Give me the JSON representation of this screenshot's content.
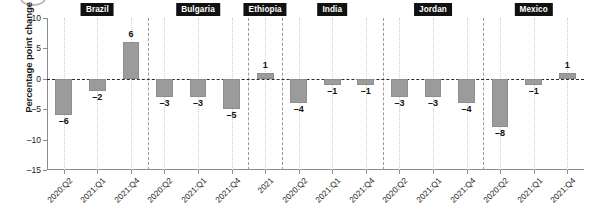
{
  "chart_data": {
    "type": "bar",
    "title": "",
    "subtitle": "",
    "xlabel": "",
    "ylabel": "Percentage point change",
    "ylim": [
      -15,
      10
    ],
    "yticks": [
      10,
      5,
      0,
      -5,
      -10,
      -15
    ],
    "ytick_labels": [
      "10",
      "5",
      "0",
      "-5",
      "-10",
      "-15"
    ],
    "grid": true,
    "grid_orientation": "vertical",
    "legend": null,
    "zero_line": true,
    "panel_layout": "faceted-by-country",
    "bar_color": "#9b9b9b",
    "panels": [
      {
        "label": "Brazil",
        "categories": [
          "2020:Q2",
          "2021:Q1",
          "2021:Q4"
        ],
        "values": [
          -6,
          -2,
          6
        ],
        "value_labels": [
          "–6",
          "–2",
          "6"
        ]
      },
      {
        "label": "Bulgaria",
        "categories": [
          "2020:Q2",
          "2021:Q1",
          "2021:Q4"
        ],
        "values": [
          -3,
          -3,
          -5
        ],
        "value_labels": [
          "–3",
          "–3",
          "–5"
        ]
      },
      {
        "label": "Ethiopia",
        "categories": [
          "2021"
        ],
        "values": [
          1
        ],
        "value_labels": [
          "1"
        ]
      },
      {
        "label": "India",
        "categories": [
          "2020:Q2",
          "2021:Q1",
          "2021:Q4"
        ],
        "values": [
          -4,
          -1,
          -1
        ],
        "value_labels": [
          "–4",
          "–1",
          "–1"
        ]
      },
      {
        "label": "Jordan",
        "categories": [
          "2020:Q2",
          "2021:Q1",
          "2021:Q4"
        ],
        "values": [
          -3,
          -3,
          -4
        ],
        "value_labels": [
          "–3",
          "–3",
          "–4"
        ]
      },
      {
        "label": "Mexico",
        "categories": [
          "2020:Q2",
          "2021:Q1",
          "2021:Q4"
        ],
        "values": [
          -8,
          -1,
          1
        ],
        "value_labels": [
          "–8",
          "–1",
          "1"
        ]
      }
    ]
  },
  "axes": {
    "y_title": "Percentage point change"
  },
  "colors": {
    "bar": "#9b9b9b",
    "zero_line": "#2b2b2b",
    "gridline": "#cfcfcf",
    "panel_divider": "#9a9a9a",
    "axis": "#8c8c8c",
    "chip_background": "#111111",
    "chip_text": "#ffffff",
    "text": "#1a1a1a"
  }
}
